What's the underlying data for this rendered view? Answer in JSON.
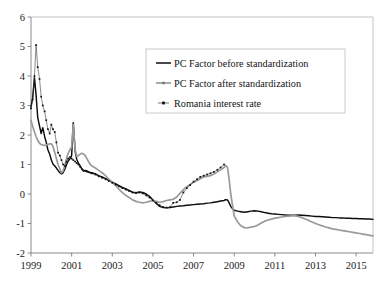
{
  "chart_data": {
    "type": "line",
    "title": "",
    "xlabel": "",
    "ylabel": "",
    "xlim": [
      1999.0,
      2015.83
    ],
    "ylim": [
      -2,
      6
    ],
    "grid": false,
    "legend_position": "top-center-right",
    "y_ticks": [
      6,
      5,
      4,
      3,
      2,
      1,
      0,
      -1,
      -2
    ],
    "y_tick_labels": [
      "6",
      "5",
      "4",
      "3",
      "2",
      "1",
      "0",
      "-1",
      "-2"
    ],
    "x_ticks": [
      1999,
      2001,
      2003,
      2005,
      2007,
      2009,
      2011,
      2013,
      2015
    ],
    "x_tick_labels": [
      "1999",
      "2001",
      "2003",
      "2005",
      "2007",
      "2009",
      "2011",
      "2013",
      "2015"
    ],
    "series": [
      {
        "name": "PC Factor before standardization",
        "key": "pc_before",
        "color": "#0d0d0d",
        "style": "solid-line",
        "x": [
          1999.0,
          1999.08,
          1999.17,
          1999.25,
          1999.33,
          1999.42,
          1999.5,
          1999.58,
          1999.67,
          1999.75,
          1999.83,
          1999.92,
          2000.0,
          2000.08,
          2000.17,
          2000.25,
          2000.33,
          2000.42,
          2000.5,
          2000.58,
          2000.67,
          2000.75,
          2000.83,
          2000.92,
          2001.0,
          2001.08,
          2001.17,
          2001.25,
          2001.33,
          2001.42,
          2001.5,
          2001.58,
          2001.67,
          2001.75,
          2001.83,
          2001.92,
          2002.0,
          2002.17,
          2002.33,
          2002.5,
          2002.67,
          2002.83,
          2003.0,
          2003.17,
          2003.33,
          2003.5,
          2003.67,
          2003.83,
          2004.0,
          2004.17,
          2004.33,
          2004.5,
          2004.67,
          2004.83,
          2005.0,
          2005.17,
          2005.33,
          2005.5,
          2005.67,
          2005.83,
          2006.0,
          2006.17,
          2006.33,
          2006.5,
          2006.67,
          2006.83,
          2007.0,
          2007.17,
          2007.33,
          2007.5,
          2007.67,
          2007.83,
          2008.0,
          2008.17,
          2008.33,
          2008.5,
          2008.58,
          2008.67,
          2008.75,
          2008.83,
          2008.92,
          2009.0,
          2009.17,
          2009.33,
          2009.5,
          2009.67,
          2009.83,
          2010.0,
          2010.17,
          2010.33,
          2010.5,
          2010.67,
          2010.83,
          2011.0,
          2011.17,
          2011.33,
          2011.5,
          2011.67,
          2011.83,
          2012.0,
          2012.17,
          2012.33,
          2012.5,
          2012.67,
          2012.83,
          2013.0,
          2013.17,
          2013.33,
          2013.5,
          2013.67,
          2013.83,
          2014.0,
          2014.17,
          2014.33,
          2014.5,
          2014.67,
          2014.83,
          2015.0,
          2015.17,
          2015.33,
          2015.5,
          2015.67,
          2015.83
        ],
        "y": [
          2.95,
          3.25,
          3.95,
          3.35,
          2.6,
          2.3,
          2.05,
          2.25,
          1.95,
          1.75,
          1.5,
          1.35,
          1.15,
          1.02,
          0.95,
          0.88,
          0.8,
          0.72,
          0.68,
          0.72,
          0.85,
          1.0,
          1.12,
          1.2,
          1.3,
          2.42,
          1.45,
          1.18,
          1.05,
          0.95,
          0.85,
          0.78,
          0.8,
          0.78,
          0.75,
          0.73,
          0.72,
          0.68,
          0.62,
          0.58,
          0.52,
          0.46,
          0.4,
          0.34,
          0.28,
          0.22,
          0.17,
          0.12,
          0.06,
          0.04,
          0.07,
          0.05,
          0.0,
          -0.08,
          -0.2,
          -0.32,
          -0.42,
          -0.46,
          -0.47,
          -0.46,
          -0.44,
          -0.42,
          -0.41,
          -0.4,
          -0.38,
          -0.37,
          -0.36,
          -0.35,
          -0.34,
          -0.33,
          -0.31,
          -0.3,
          -0.28,
          -0.26,
          -0.24,
          -0.22,
          -0.19,
          -0.2,
          -0.3,
          -0.42,
          -0.5,
          -0.55,
          -0.58,
          -0.6,
          -0.62,
          -0.6,
          -0.58,
          -0.57,
          -0.58,
          -0.6,
          -0.63,
          -0.65,
          -0.67,
          -0.68,
          -0.69,
          -0.7,
          -0.71,
          -0.72,
          -0.72,
          -0.72,
          -0.71,
          -0.72,
          -0.73,
          -0.74,
          -0.75,
          -0.76,
          -0.76,
          -0.77,
          -0.78,
          -0.79,
          -0.8,
          -0.8,
          -0.81,
          -0.81,
          -0.82,
          -0.82,
          -0.83,
          -0.83,
          -0.84,
          -0.84,
          -0.85,
          -0.85,
          -0.86
        ]
      },
      {
        "name": "PC Factor after standardization",
        "key": "pc_after",
        "color": "#9a9a9a",
        "style": "solid-line-thick",
        "x": [
          1999.0,
          1999.08,
          1999.17,
          1999.25,
          1999.33,
          1999.42,
          1999.5,
          1999.58,
          1999.67,
          1999.75,
          1999.83,
          1999.92,
          2000.0,
          2000.08,
          2000.17,
          2000.25,
          2000.33,
          2000.42,
          2000.5,
          2000.58,
          2000.67,
          2000.75,
          2000.83,
          2000.92,
          2001.0,
          2001.08,
          2001.17,
          2001.25,
          2001.33,
          2001.42,
          2001.5,
          2001.58,
          2001.67,
          2001.75,
          2001.83,
          2001.92,
          2002.0,
          2002.17,
          2002.33,
          2002.5,
          2002.67,
          2002.83,
          2003.0,
          2003.17,
          2003.33,
          2003.5,
          2003.67,
          2003.83,
          2004.0,
          2004.17,
          2004.33,
          2004.5,
          2004.67,
          2004.83,
          2005.0,
          2005.17,
          2005.33,
          2005.5,
          2005.67,
          2005.83,
          2006.0,
          2006.17,
          2006.33,
          2006.5,
          2006.67,
          2006.83,
          2007.0,
          2007.17,
          2007.33,
          2007.5,
          2007.67,
          2007.83,
          2008.0,
          2008.17,
          2008.33,
          2008.5,
          2008.58,
          2008.67,
          2008.75,
          2008.83,
          2008.92,
          2009.0,
          2009.17,
          2009.33,
          2009.5,
          2009.67,
          2009.83,
          2010.0,
          2010.17,
          2010.33,
          2010.5,
          2010.67,
          2010.83,
          2011.0,
          2011.17,
          2011.33,
          2011.5,
          2011.67,
          2011.83,
          2012.0,
          2012.17,
          2012.33,
          2012.5,
          2012.67,
          2012.83,
          2013.0,
          2013.17,
          2013.33,
          2013.5,
          2013.67,
          2013.83,
          2014.0,
          2014.17,
          2014.33,
          2014.5,
          2014.67,
          2014.83,
          2015.0,
          2015.17,
          2015.33,
          2015.5,
          2015.67,
          2015.83
        ],
        "y": [
          2.5,
          2.3,
          2.1,
          1.95,
          1.82,
          1.72,
          1.68,
          1.66,
          1.65,
          1.66,
          1.68,
          1.7,
          1.7,
          1.62,
          1.4,
          1.2,
          1.0,
          0.85,
          0.72,
          0.78,
          1.0,
          1.2,
          1.38,
          1.5,
          1.6,
          2.35,
          1.5,
          1.28,
          1.3,
          1.35,
          1.38,
          1.36,
          1.3,
          1.2,
          1.1,
          1.0,
          0.95,
          0.88,
          0.8,
          0.72,
          0.62,
          0.5,
          0.4,
          0.28,
          0.16,
          0.05,
          -0.05,
          -0.12,
          -0.2,
          -0.25,
          -0.28,
          -0.3,
          -0.28,
          -0.25,
          -0.22,
          -0.25,
          -0.28,
          -0.26,
          -0.22,
          -0.2,
          -0.18,
          -0.1,
          0.02,
          0.15,
          0.25,
          0.32,
          0.4,
          0.45,
          0.52,
          0.58,
          0.6,
          0.62,
          0.68,
          0.75,
          0.82,
          0.9,
          0.97,
          0.9,
          0.5,
          0.0,
          -0.4,
          -0.75,
          -0.95,
          -1.08,
          -1.14,
          -1.15,
          -1.12,
          -1.1,
          -1.05,
          -0.98,
          -0.92,
          -0.88,
          -0.85,
          -0.82,
          -0.8,
          -0.78,
          -0.76,
          -0.75,
          -0.74,
          -0.74,
          -0.76,
          -0.8,
          -0.85,
          -0.9,
          -0.95,
          -1.0,
          -1.04,
          -1.08,
          -1.12,
          -1.15,
          -1.18,
          -1.2,
          -1.22,
          -1.24,
          -1.26,
          -1.28,
          -1.3,
          -1.32,
          -1.34,
          -1.36,
          -1.38,
          -1.4,
          -1.42
        ]
      },
      {
        "name": "Romania interest rate",
        "key": "romania",
        "color": "#111111",
        "style": "dotted-markers",
        "x": [
          1999.0,
          1999.08,
          1999.17,
          1999.25,
          1999.33,
          1999.42,
          1999.5,
          1999.58,
          1999.67,
          1999.75,
          1999.83,
          1999.92,
          2000.0,
          2000.08,
          2000.17,
          2000.25,
          2000.33,
          2000.42,
          2000.5,
          2000.58,
          2000.67,
          2000.75,
          2000.83,
          2000.92,
          2001.0,
          2001.08,
          2001.17,
          2001.25,
          2001.33,
          2001.42,
          2001.5,
          2001.58,
          2001.67,
          2001.75,
          2001.83,
          2001.92,
          2002.0,
          2002.17,
          2002.33,
          2002.5,
          2002.67,
          2002.83,
          2003.0,
          2003.17,
          2003.33,
          2003.5,
          2003.67,
          2003.83,
          2004.0,
          2004.17,
          2004.33,
          2004.5,
          2004.67,
          2004.83,
          2005.0,
          2005.17,
          2005.33,
          2005.5,
          2005.67,
          2005.83,
          2006.0,
          2006.17,
          2006.33,
          2006.5,
          2006.67,
          2006.83,
          2007.0,
          2007.17,
          2007.33,
          2007.5,
          2007.67,
          2007.83,
          2008.0,
          2008.17,
          2008.33,
          2008.5
        ],
        "y": [
          2.9,
          3.2,
          4.0,
          5.05,
          4.3,
          3.9,
          3.3,
          3.0,
          2.8,
          2.5,
          2.2,
          2.05,
          2.35,
          2.2,
          2.1,
          1.75,
          1.4,
          1.3,
          1.15,
          1.0,
          0.95,
          1.1,
          1.2,
          1.25,
          1.2,
          1.15,
          1.1,
          1.05,
          1.0,
          0.92,
          0.85,
          0.8,
          0.78,
          0.76,
          0.74,
          0.72,
          0.7,
          0.66,
          0.6,
          0.55,
          0.5,
          0.44,
          0.38,
          0.32,
          0.26,
          0.2,
          0.15,
          0.1,
          0.05,
          0.03,
          0.05,
          0.02,
          -0.05,
          -0.12,
          -0.22,
          -0.3,
          -0.38,
          -0.44,
          -0.46,
          -0.45,
          -0.3,
          -0.28,
          -0.2,
          0.05,
          0.2,
          0.3,
          0.42,
          0.5,
          0.58,
          0.62,
          0.66,
          0.7,
          0.75,
          0.82,
          0.9,
          1.0
        ]
      }
    ]
  },
  "legend": {
    "items": [
      {
        "label": "PC Factor before standardization",
        "marker": "line-solid-black"
      },
      {
        "label": "PC Factor after standardization",
        "marker": "line-solid-gray-marker"
      },
      {
        "label": "Romania interest rate",
        "marker": "dotted-marker"
      }
    ]
  },
  "colors": {
    "series_black": "#0d0d0d",
    "series_gray": "#9a9a9a",
    "series_dots": "#111111",
    "axis": "#7d7d7d",
    "frame": "#b4b4b4",
    "background": "#ffffff"
  }
}
